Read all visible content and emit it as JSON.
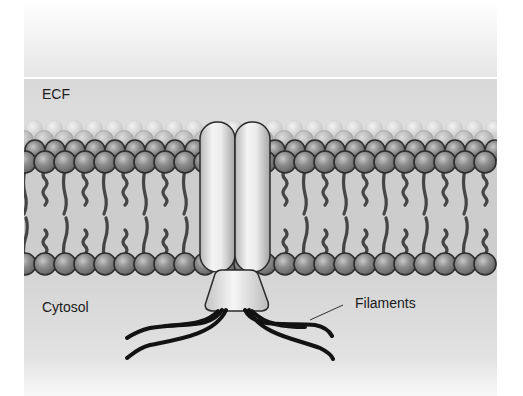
{
  "diagram": {
    "labels": {
      "ecf": "ECF",
      "cytosol": "Cytosol",
      "filaments": "Filaments"
    },
    "regions": [
      "ECF",
      "Lipid bilayer",
      "Cytosol"
    ],
    "components": [
      "Phospholipid heads (outer leaflet)",
      "Phospholipid tails",
      "Phospholipid heads (inner leaflet)",
      "Transmembrane protein (two cylinders)",
      "Cytoplasmic cone domain",
      "Filaments"
    ],
    "colors": {
      "background": "#ffffff",
      "ecf_fill": "#dcdcdc",
      "cytosol_fill": "#d6d6d6",
      "head_fill": "#8c8c8c",
      "head_stroke": "#2e2e2e",
      "tail": "#4a4a4a",
      "protein_fill": "#e8e8e8",
      "filament": "#111111"
    }
  }
}
